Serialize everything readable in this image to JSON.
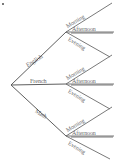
{
  "diagram": {
    "type": "tree-diagram",
    "background_color": "#ffffff",
    "line_color": "#6a6a6a",
    "text_color": "#4a4a4a",
    "root": {
      "label": ""
    },
    "level1": [
      {
        "id": "english",
        "label": "English",
        "direction": "up"
      },
      {
        "id": "french",
        "label": "French",
        "direction": "straight"
      },
      {
        "id": "math",
        "label": "Math",
        "direction": "down"
      }
    ],
    "level2_labels": [
      "Morning",
      "Afternoon",
      "Evening"
    ],
    "branches": [
      {
        "subject": "English",
        "times": [
          {
            "label": "Morning",
            "direction": "up"
          },
          {
            "label": "Afternoon",
            "direction": "straight"
          },
          {
            "label": "Evening",
            "direction": "down"
          }
        ]
      },
      {
        "subject": "French",
        "times": [
          {
            "label": "Morning",
            "direction": "up"
          },
          {
            "label": "Afternoon",
            "direction": "straight"
          },
          {
            "label": "Evening",
            "direction": "down"
          }
        ]
      },
      {
        "subject": "Math",
        "times": [
          {
            "label": "Morning",
            "direction": "up"
          },
          {
            "label": "Afternoon",
            "direction": "straight"
          },
          {
            "label": "Evening",
            "direction": "down"
          }
        ]
      }
    ]
  }
}
